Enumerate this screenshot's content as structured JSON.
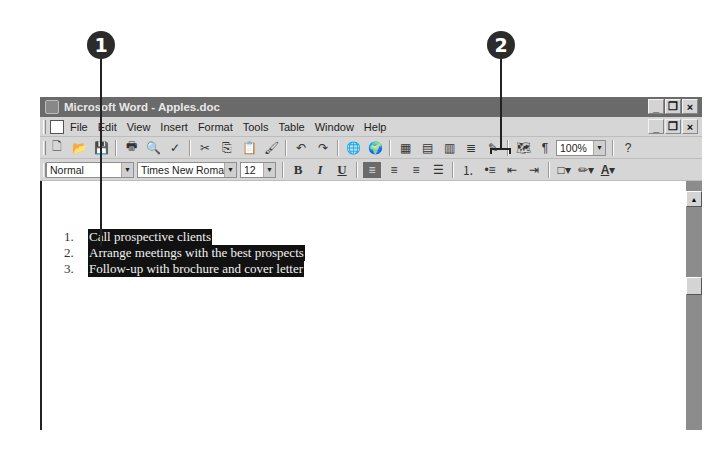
{
  "callouts": [
    {
      "label": "1",
      "target": "selected-list-text"
    },
    {
      "label": "2",
      "target": "numbering-and-bullets-buttons"
    }
  ],
  "window": {
    "title": "Microsoft Word - Apples.doc",
    "controls": {
      "minimize": "_",
      "restore": "❐",
      "close": "×"
    }
  },
  "menubar": {
    "items": [
      "File",
      "Edit",
      "View",
      "Insert",
      "Format",
      "Tools",
      "Table",
      "Window",
      "Help"
    ],
    "doc_controls": {
      "minimize": "_",
      "restore": "❐",
      "close": "×"
    }
  },
  "standard_toolbar": {
    "icons": [
      "new-icon",
      "open-icon",
      "save-icon",
      "print-icon",
      "print-preview-icon",
      "spelling-icon",
      "cut-icon",
      "copy-icon",
      "paste-icon",
      "format-painter-icon",
      "undo-icon",
      "redo-icon",
      "hyperlink-icon",
      "web-toolbar-icon",
      "tables-borders-icon",
      "insert-table-icon",
      "insert-excel-icon",
      "columns-icon",
      "drawing-icon",
      "document-map-icon",
      "show-hide-icon",
      "help-icon"
    ],
    "zoom": "100%"
  },
  "formatting_toolbar": {
    "style": "Normal",
    "font": "Times New Roman",
    "size": "12",
    "bold": "B",
    "italic": "I",
    "underline": "U",
    "font_color_label": "A"
  },
  "document": {
    "list": [
      {
        "num": "1.",
        "text": "Call prospective clients"
      },
      {
        "num": "2.",
        "text": "Arrange meetings with the best prospects"
      },
      {
        "num": "3.",
        "text": "Follow-up with brochure and cover letter"
      }
    ]
  }
}
